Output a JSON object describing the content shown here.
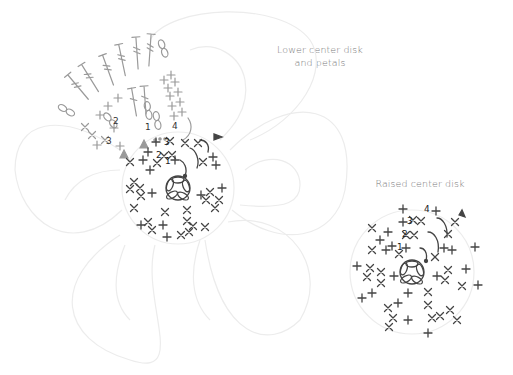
{
  "labels": {
    "lower": "Lower center disk and petals",
    "lower_line1": "Lower center disk",
    "lower_line2": "and petals",
    "raised": "Raised center disk"
  },
  "lower_disk": {
    "row_numbers": [
      "1",
      "2",
      "3",
      "4"
    ],
    "petal_row_numbers": [
      "1",
      "2",
      "3",
      "4"
    ],
    "center": {
      "x": 178,
      "y": 188
    },
    "radius": 55,
    "petal_count": 6
  },
  "raised_disk": {
    "row_numbers": [
      "1",
      "2",
      "3",
      "4"
    ],
    "center": {
      "x": 412,
      "y": 272
    },
    "radius": 62
  },
  "colors": {
    "stitch_dark": "#444444",
    "stitch_grey": "#9a9a9a",
    "outline": "#ececec",
    "label": "#7a7a7a"
  }
}
